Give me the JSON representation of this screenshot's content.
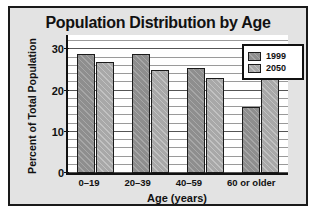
{
  "chart_data": {
    "type": "bar",
    "title": "Population Distribution by Age",
    "xlabel": "Age (years)",
    "ylabel": "Percent of Total Population",
    "categories": [
      "0–19",
      "20–39",
      "40–59",
      "60 or older"
    ],
    "series": [
      {
        "name": "1999",
        "values": [
          29,
          29,
          25.5,
          16
        ],
        "color": "#8e8e8e"
      },
      {
        "name": "2050",
        "values": [
          27,
          25,
          23,
          25
        ],
        "color": "#a8a8a8"
      }
    ],
    "ylim": [
      0,
      34
    ],
    "yticks": [
      0,
      10,
      20,
      30
    ],
    "ytick_labels": [
      "0",
      "10",
      "20",
      "30"
    ],
    "minor_tick_step": 2,
    "grid": true,
    "legend_position": "top-right"
  },
  "style": {
    "panel_background": "#e3e3e3",
    "plot_background": "#ffffff",
    "frame_color": "#1a1a1a",
    "text_color": "#111111"
  }
}
